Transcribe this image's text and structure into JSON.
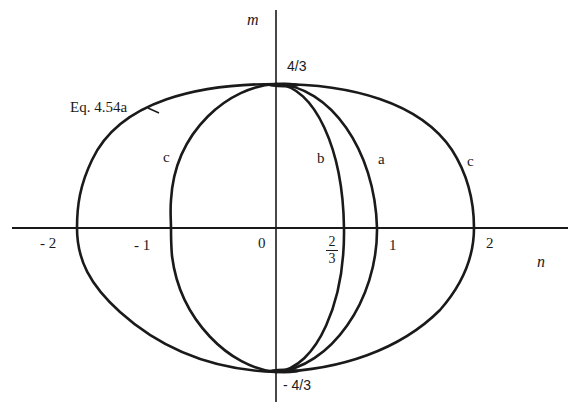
{
  "figure": {
    "axes": {
      "x_label": "n",
      "y_label": "m",
      "x_ticks": [
        {
          "value": -2,
          "label": "- 2"
        },
        {
          "value": -1,
          "label": "- 1"
        },
        {
          "value": 0,
          "label": "0"
        },
        {
          "value": 0.6667,
          "label_num": "2",
          "label_den": "3"
        },
        {
          "value": 1,
          "label": "1"
        },
        {
          "value": 2,
          "label": "2"
        }
      ],
      "y_ticks": [
        {
          "value": 1.3333,
          "label": "4/3"
        },
        {
          "value": -1.3333,
          "label": "- 4/3"
        }
      ]
    },
    "curves": [
      {
        "id": "eq",
        "label": "Eq. 4.54a",
        "description": "Outer interaction curve spanning n from -2 to 2, m from -4/3 to 4/3"
      },
      {
        "id": "a",
        "label": "a",
        "description": "Curve through n = 1"
      },
      {
        "id": "b",
        "label": "b",
        "description": "Curve through n = 2/3"
      },
      {
        "id": "c",
        "label": "c",
        "label_right": "c",
        "description": "Curve through n = -1 and n = 2"
      }
    ],
    "colors": {
      "ink": "#1a1a1a",
      "background": "#ffffff"
    }
  }
}
